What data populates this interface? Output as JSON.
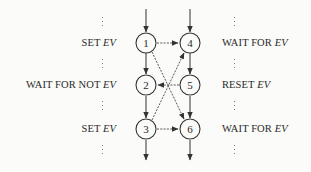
{
  "diagram": {
    "type": "process-synchronization-flow",
    "left_process": {
      "labels": [
        {
          "prefix": "SET ",
          "var": "EV",
          "node": "1"
        },
        {
          "prefix": "WAIT FOR NOT ",
          "var": "EV",
          "node": "2"
        },
        {
          "prefix": "SET ",
          "var": "EV",
          "node": "3"
        }
      ]
    },
    "right_process": {
      "labels": [
        {
          "prefix": "WAIT FOR ",
          "var": "EV",
          "node": "4"
        },
        {
          "prefix": "RESET ",
          "var": "EV",
          "node": "5"
        },
        {
          "prefix": "WAIT FOR ",
          "var": "EV",
          "node": "6"
        }
      ]
    },
    "nodes": [
      {
        "id": "1",
        "label": "1"
      },
      {
        "id": "2",
        "label": "2"
      },
      {
        "id": "3",
        "label": "3"
      },
      {
        "id": "4",
        "label": "4"
      },
      {
        "id": "5",
        "label": "5"
      },
      {
        "id": "6",
        "label": "6"
      }
    ],
    "edges": [
      {
        "from": "1",
        "to": "2",
        "style": "solid"
      },
      {
        "from": "2",
        "to": "3",
        "style": "solid"
      },
      {
        "from": "4",
        "to": "5",
        "style": "solid"
      },
      {
        "from": "5",
        "to": "6",
        "style": "solid"
      },
      {
        "from": "1",
        "to": "4",
        "style": "dashed"
      },
      {
        "from": "1",
        "to": "6",
        "style": "dashed"
      },
      {
        "from": "3",
        "to": "4",
        "style": "dashed"
      },
      {
        "from": "3",
        "to": "6",
        "style": "dashed"
      },
      {
        "from": "5",
        "to": "2",
        "style": "dashed"
      }
    ],
    "ellipsis": "⋮"
  }
}
